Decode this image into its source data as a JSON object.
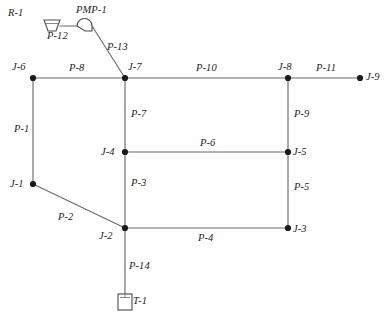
{
  "diagram": {
    "type": "hydraulic-network-schematic",
    "canvas": {
      "width": 389,
      "height": 325
    },
    "colors": {
      "background": "#ffffff",
      "pipe": "#6b6b6b",
      "node": "#1a1a1a",
      "symbol": "#4a4a4a",
      "text": "#1c1c1c"
    }
  },
  "nodes": [
    {
      "id": "R-1",
      "kind": "reservoir",
      "label": "R-1",
      "x": 52,
      "y": 24,
      "label_x": 8,
      "label_y": 8
    },
    {
      "id": "PMP-1",
      "kind": "pump",
      "label": "PMP-1",
      "x": 85,
      "y": 21,
      "label_x": 76,
      "label_y": 5
    },
    {
      "id": "J-6",
      "kind": "junction",
      "label": "J-6",
      "x": 33,
      "y": 78,
      "label_x": 12,
      "label_y": 62
    },
    {
      "id": "J-7",
      "kind": "junction",
      "label": "J-7",
      "x": 125,
      "y": 78,
      "label_x": 128,
      "label_y": 62
    },
    {
      "id": "J-8",
      "kind": "junction",
      "label": "J-8",
      "x": 288,
      "y": 78,
      "label_x": 278,
      "label_y": 62
    },
    {
      "id": "J-9",
      "kind": "junction",
      "label": "J-9",
      "x": 360,
      "y": 78,
      "label_x": 366,
      "label_y": 72
    },
    {
      "id": "J-1",
      "kind": "junction",
      "label": "J-1",
      "x": 33,
      "y": 184,
      "label_x": 10,
      "label_y": 179
    },
    {
      "id": "J-4",
      "kind": "junction",
      "label": "J-4",
      "x": 125,
      "y": 152,
      "label_x": 101,
      "label_y": 147
    },
    {
      "id": "J-5",
      "kind": "junction",
      "label": "J-5",
      "x": 288,
      "y": 152,
      "label_x": 293,
      "label_y": 147
    },
    {
      "id": "J-2",
      "kind": "junction",
      "label": "J-2",
      "x": 125,
      "y": 228,
      "label_x": 99,
      "label_y": 231
    },
    {
      "id": "J-3",
      "kind": "junction",
      "label": "J-3",
      "x": 288,
      "y": 228,
      "label_x": 293,
      "label_y": 224
    },
    {
      "id": "T-1",
      "kind": "tank",
      "label": "T-1",
      "x": 125,
      "y": 303,
      "label_x": 133,
      "label_y": 296
    }
  ],
  "pipes": [
    {
      "id": "P-12",
      "label": "P-12",
      "from": "R-1",
      "to": "PMP-1",
      "label_x": 47,
      "label_y": 31
    },
    {
      "id": "P-13",
      "label": "P-13",
      "from": "PMP-1",
      "to": "J-7",
      "label_x": 107,
      "label_y": 42
    },
    {
      "id": "P-8",
      "label": "P-8",
      "from": "J-6",
      "to": "J-7",
      "label_x": 69,
      "label_y": 63
    },
    {
      "id": "P-10",
      "label": "P-10",
      "from": "J-7",
      "to": "J-8",
      "label_x": 196,
      "label_y": 63
    },
    {
      "id": "P-11",
      "label": "P-11",
      "from": "J-8",
      "to": "J-9",
      "label_x": 316,
      "label_y": 63
    },
    {
      "id": "P-1",
      "label": "P-1",
      "from": "J-6",
      "to": "J-1",
      "label_x": 14,
      "label_y": 124
    },
    {
      "id": "P-7",
      "label": "P-7",
      "from": "J-7",
      "to": "J-4",
      "label_x": 131,
      "label_y": 109
    },
    {
      "id": "P-9",
      "label": "P-9",
      "from": "J-8",
      "to": "J-5",
      "label_x": 294,
      "label_y": 109
    },
    {
      "id": "P-6",
      "label": "P-6",
      "from": "J-4",
      "to": "J-5",
      "label_x": 200,
      "label_y": 138
    },
    {
      "id": "P-3",
      "label": "P-3",
      "from": "J-4",
      "to": "J-2",
      "label_x": 131,
      "label_y": 178
    },
    {
      "id": "P-5",
      "label": "P-5",
      "from": "J-5",
      "to": "J-3",
      "label_x": 294,
      "label_y": 182
    },
    {
      "id": "P-2",
      "label": "P-2",
      "from": "J-1",
      "to": "J-2",
      "label_x": 58,
      "label_y": 212
    },
    {
      "id": "P-4",
      "label": "P-4",
      "from": "J-2",
      "to": "J-3",
      "label_x": 198,
      "label_y": 233
    },
    {
      "id": "P-14",
      "label": "P-14",
      "from": "J-2",
      "to": "T-1",
      "label_x": 129,
      "label_y": 261
    }
  ]
}
